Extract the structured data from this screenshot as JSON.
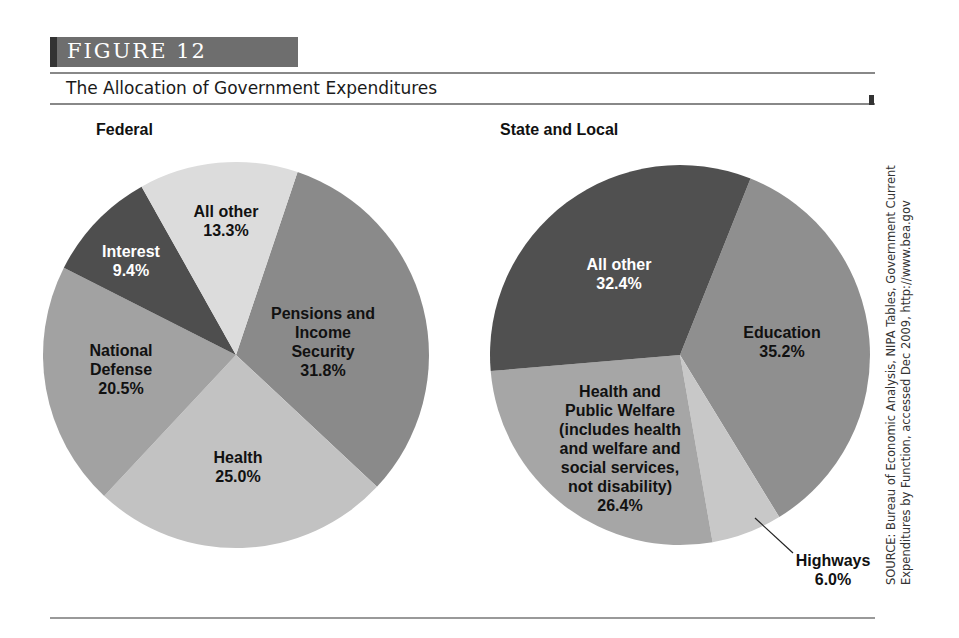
{
  "figure": {
    "label": "FIGURE  12",
    "title": "The Allocation of Government Expenditures",
    "source": "SOURCE: Bureau of Economic Analysis, NIPA Tables, Government Current Expenditures by Function, accessed Dec 2009, http://www.bea.gov"
  },
  "chart_data": [
    {
      "type": "pie",
      "title": "Federal",
      "center": [
        236,
        355
      ],
      "radius": 193,
      "start_angle_deg": 18.6,
      "slices": [
        {
          "label": "Pensions and\nIncome\nSecurity",
          "value": 31.8,
          "display": "31.8%",
          "color": "#8a8a8a",
          "text_color": "#111",
          "label_pos": [
            323,
            304
          ]
        },
        {
          "label": "Health",
          "value": 25.0,
          "display": "25.0%",
          "color": "#c2c2c2",
          "text_color": "#111",
          "label_pos": [
            238,
            448
          ]
        },
        {
          "label": "National\nDefense",
          "value": 20.5,
          "display": "20.5%",
          "color": "#a2a2a2",
          "text_color": "#111",
          "label_pos": [
            121,
            341
          ]
        },
        {
          "label": "Interest",
          "value": 9.4,
          "display": "9.4%",
          "color": "#4e4e4e",
          "text_color": "#fff",
          "label_pos": [
            131,
            242
          ]
        },
        {
          "label": "All other",
          "value": 13.3,
          "display": "13.3%",
          "color": "#dcdcdc",
          "text_color": "#111",
          "label_pos": [
            226,
            202
          ]
        }
      ]
    },
    {
      "type": "pie",
      "title": "State and Local",
      "center": [
        680,
        355
      ],
      "radius": 190,
      "start_angle_deg": 21.8,
      "slices": [
        {
          "label": "Education",
          "value": 35.2,
          "display": "35.2%",
          "color": "#8f8f8f",
          "text_color": "#111",
          "label_pos": [
            782,
            323
          ]
        },
        {
          "label": "Highways",
          "value": 6.0,
          "display": "6.0%",
          "color": "#c8c8c8",
          "text_color": "#111",
          "label_pos": [
            833,
            551
          ],
          "leader": [
            [
              755,
              518
            ],
            [
              793,
              553
            ]
          ]
        },
        {
          "label": "Health and\nPublic Welfare\n(includes health\nand welfare and\nsocial services,\nnot disability)",
          "value": 26.4,
          "display": "26.4%",
          "color": "#a6a6a6",
          "text_color": "#111",
          "label_pos": [
            620,
            382
          ]
        },
        {
          "label": "All other",
          "value": 32.4,
          "display": "32.4%",
          "color": "#505050",
          "text_color": "#fff",
          "label_pos": [
            619,
            255
          ]
        }
      ]
    }
  ]
}
